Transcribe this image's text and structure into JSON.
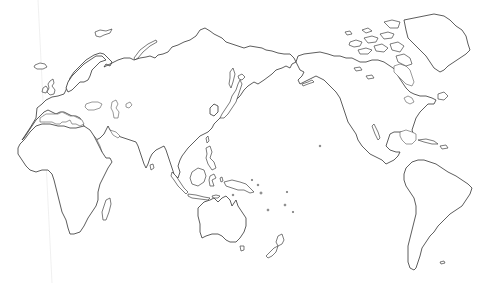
{
  "map": {
    "type": "blank outline world map",
    "projection": "Pacific-centered (Robinson-like)",
    "center_longitude": "150E",
    "labels": [],
    "colors": {
      "background": "#ffffff",
      "coastline": "#333333",
      "land_fill": "#ffffff"
    },
    "regions_shown": [
      "Europe",
      "Africa",
      "Asia",
      "Australia",
      "New Zealand",
      "North America",
      "Greenland",
      "Central America",
      "South America",
      "Madagascar",
      "Japan",
      "Indonesia",
      "Philippines",
      "Papua New Guinea",
      "Iceland",
      "British Isles",
      "Svalbard",
      "Novaya Zemlya",
      "Canadian Arctic Archipelago",
      "Caribbean",
      "Pacific Islands",
      "Falkland Islands"
    ],
    "lakes_shown": [
      "Caspian Sea",
      "Aral Sea",
      "Great Lakes",
      "Hudson Bay"
    ]
  }
}
